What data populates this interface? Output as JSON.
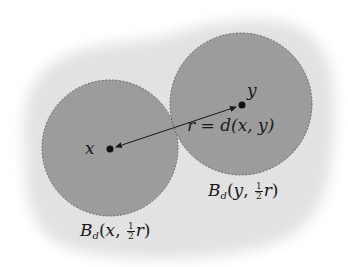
{
  "diagram": {
    "colors": {
      "background": "#ffffff",
      "blob": "#e2e2e2",
      "ball_fill": "#9c9c9c",
      "ball_stroke": "#555555",
      "ink": "#1a1a1a"
    },
    "points": {
      "x": {
        "label": "x",
        "cx": 110,
        "cy": 149
      },
      "y": {
        "label": "y",
        "cx": 242,
        "cy": 105
      }
    },
    "balls": [
      {
        "name": "ball-x",
        "cx": 110,
        "cy": 148,
        "r": 68
      },
      {
        "name": "ball-y",
        "cx": 241,
        "cy": 104,
        "r": 71
      }
    ],
    "distance_label": {
      "r": "r",
      "eq": " = ",
      "d": "d",
      "args": "(x, y)"
    },
    "ball_labels": {
      "ball_x": {
        "B": "B",
        "sub": "d",
        "open": "(",
        "center": "x",
        "sep": ", ",
        "frac_num": "1",
        "frac_den": "2",
        "r": "r",
        "close": ")"
      },
      "ball_y": {
        "B": "B",
        "sub": "d",
        "open": "(",
        "center": "y",
        "sep": ", ",
        "frac_num": "1",
        "frac_den": "2",
        "r": "r",
        "close": ")"
      }
    }
  }
}
